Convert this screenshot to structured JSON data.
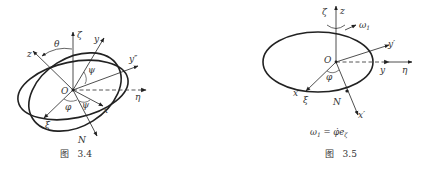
{
  "figures": [
    {
      "id": "fig-3-4",
      "caption": "图   3.4",
      "labels": {
        "zeta": "ζ",
        "z": "z",
        "y": "y",
        "y_double_prime": "y″",
        "eta": "η",
        "x": "x",
        "xi": "ξ",
        "N": "N",
        "origin": "O",
        "theta": "θ",
        "psi_upper": "ψ",
        "psi_lower": "ψ",
        "phi": "φ"
      }
    },
    {
      "id": "fig-3-5",
      "caption": "图   3.5",
      "labels": {
        "zeta": "ζ",
        "z": "z",
        "omega1": "ω",
        "omega1_sub": "1",
        "y_prime": "y′",
        "y": "y",
        "eta": "η",
        "x": "x",
        "xi": "ξ",
        "N": "N",
        "x_prime": "x′",
        "origin": "O",
        "phi": "φ"
      },
      "formula": {
        "lhs": "ω",
        "lhs_sub": "1",
        "eq": " = ",
        "rhs": "φ̇e",
        "rhs_sub": "ζ"
      }
    }
  ],
  "colors": {
    "stroke": "#222222",
    "dashed": "#555555",
    "text": "#333333"
  }
}
